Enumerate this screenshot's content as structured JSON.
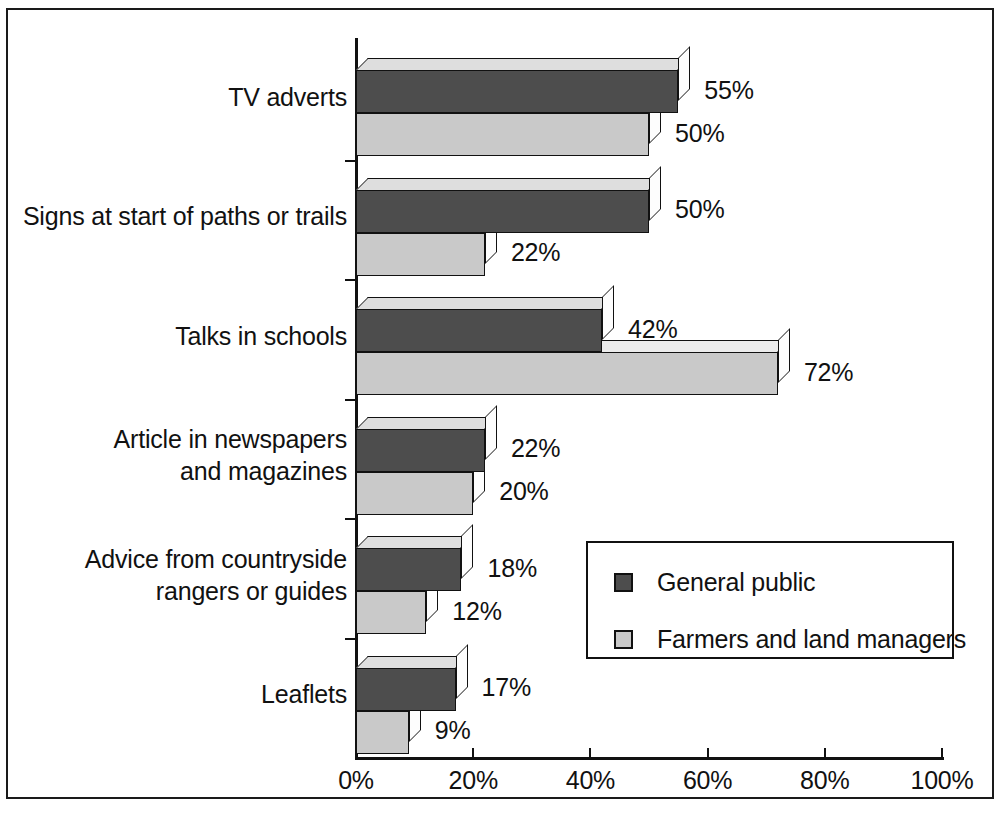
{
  "chart_data": {
    "type": "bar",
    "orientation": "horizontal",
    "title": "",
    "xlabel": "",
    "ylabel": "",
    "xlim": [
      0,
      100
    ],
    "grid": false,
    "legend_position": "center-right",
    "tick_suffix": "%",
    "categories": [
      "TV adverts",
      "Signs at start of paths or trails",
      "Talks in schools",
      "Article in newspapers\nand magazines",
      "Advice from countryside\nrangers or guides",
      "Leaflets"
    ],
    "xticks": [
      0,
      20,
      40,
      60,
      80,
      100
    ],
    "xtick_labels": [
      "0%",
      "20%",
      "40%",
      "60%",
      "80%",
      "100%"
    ],
    "series": [
      {
        "name": "General public",
        "color": "#4d4d4d",
        "values": [
          55,
          50,
          42,
          22,
          18,
          17
        ],
        "value_labels": [
          "55%",
          "50%",
          "42%",
          "22%",
          "18%",
          "17%"
        ]
      },
      {
        "name": "Farmers and land managers",
        "color": "#c9c9c9",
        "values": [
          50,
          22,
          72,
          20,
          12,
          9
        ],
        "value_labels": [
          "50%",
          "22%",
          "72%",
          "20%",
          "12%",
          "9%"
        ]
      }
    ]
  },
  "legend": {
    "entries": [
      {
        "label": "General public",
        "color": "#4d4d4d"
      },
      {
        "label": "Farmers and land managers",
        "color": "#c9c9c9"
      }
    ]
  },
  "colors": {
    "axis": "#111111",
    "frame": "#1a1a1a",
    "background": "#ffffff",
    "series_general_public": "#4d4d4d",
    "series_farmers": "#c9c9c9",
    "bar_top_face": "#e2e2e2",
    "bar_side_face": "#fdfdfd"
  }
}
